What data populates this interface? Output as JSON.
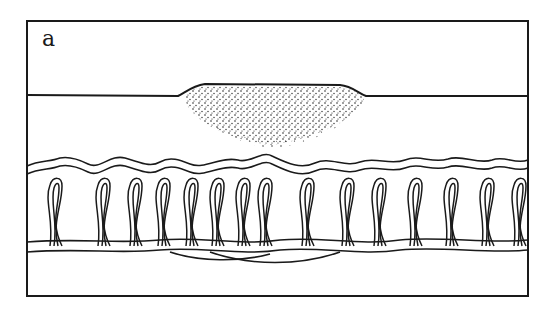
{
  "figure": {
    "panel_label": "a",
    "colors": {
      "ink": "#1a1a1a",
      "background": "#ffffff"
    },
    "frame": {
      "x": 27,
      "y": 21,
      "width": 501,
      "height": 275
    },
    "surface_line_y": 95,
    "deposit": {
      "cx": 272,
      "top": 83,
      "bottom": 145,
      "left": 182,
      "right": 365
    },
    "loop_count": 17
  }
}
